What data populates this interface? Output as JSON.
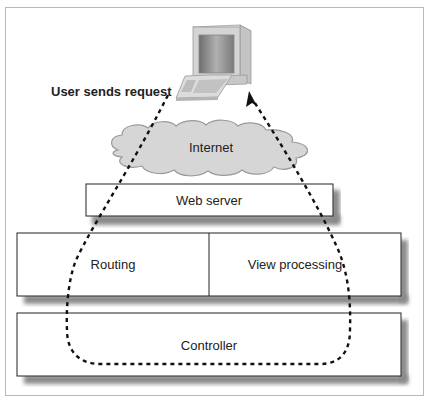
{
  "diagram": {
    "type": "request-flow",
    "caption_label": "User sends request",
    "nodes": {
      "client": {
        "label": "",
        "icon": "desktop-computer-icon"
      },
      "internet": {
        "label": "Internet",
        "shape": "cloud"
      },
      "web_server": {
        "label": "Web server"
      },
      "routing": {
        "label": "Routing"
      },
      "view_processing": {
        "label": "View processing"
      },
      "controller": {
        "label": "Controller"
      }
    },
    "flow": {
      "style": "dashed",
      "path": [
        "client",
        "internet",
        "web_server",
        "routing",
        "controller",
        "view_processing",
        "web_server",
        "internet",
        "client"
      ],
      "arrowhead_at": "client"
    },
    "colors": {
      "box_border": "#222222",
      "box_shadow": "#8a8a8a",
      "cloud_fill": "#d9d9d9",
      "frame_border": "#b8b8b8",
      "dash": "#111111"
    }
  }
}
